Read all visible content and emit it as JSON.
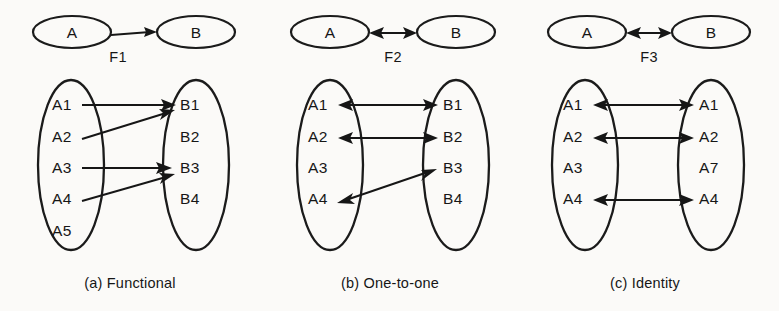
{
  "figure": {
    "background_color": "#fbfaf8",
    "ink_color": "#161616"
  },
  "panels": [
    {
      "id": "a",
      "caption": "(a)  Functional",
      "function_label": "F1",
      "arrow_type": "single",
      "source_set_label": "A",
      "target_set_label": "B",
      "source_elements": [
        "A1",
        "A2",
        "A3",
        "A4",
        "A5"
      ],
      "target_elements": [
        "B1",
        "B2",
        "B3",
        "B4"
      ],
      "mappings": [
        {
          "from": "A1",
          "to": "B1",
          "bidirectional": false
        },
        {
          "from": "A2",
          "to": "B1",
          "bidirectional": false
        },
        {
          "from": "A3",
          "to": "B3",
          "bidirectional": false
        },
        {
          "from": "A4",
          "to": "B3",
          "bidirectional": false
        }
      ]
    },
    {
      "id": "b",
      "caption": "(b)  One-to-one",
      "function_label": "F2",
      "arrow_type": "double",
      "source_set_label": "A",
      "target_set_label": "B",
      "source_elements": [
        "A1",
        "A2",
        "A3",
        "A4"
      ],
      "target_elements": [
        "B1",
        "B2",
        "B3",
        "B4"
      ],
      "mappings": [
        {
          "from": "A1",
          "to": "B1",
          "bidirectional": true
        },
        {
          "from": "A2",
          "to": "B2",
          "bidirectional": true
        },
        {
          "from": "A4",
          "to": "B3",
          "bidirectional": true
        }
      ]
    },
    {
      "id": "c",
      "caption": "(c)  Identity",
      "function_label": "F3",
      "arrow_type": "double",
      "source_set_label": "A",
      "target_set_label": "B",
      "source_elements": [
        "A1",
        "A2",
        "A3",
        "A4"
      ],
      "target_elements": [
        "A1",
        "A2",
        "A7",
        "A4"
      ],
      "mappings": [
        {
          "from": "A1",
          "to": "A1",
          "bidirectional": true
        },
        {
          "from": "A2",
          "to": "A2",
          "bidirectional": true
        },
        {
          "from": "A4",
          "to": "A4",
          "bidirectional": true
        }
      ]
    }
  ]
}
